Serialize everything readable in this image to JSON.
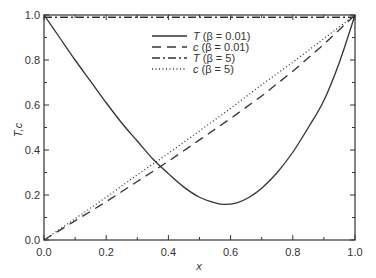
{
  "chart_data": {
    "type": "line",
    "title": "",
    "xlabel": "x",
    "ylabel": "T,c",
    "xlim": [
      0.0,
      1.0
    ],
    "ylim": [
      0.0,
      1.0
    ],
    "grid": false,
    "legend_position": "upper center",
    "x_ticks": [
      "0.0",
      "0.2",
      "0.4",
      "0.6",
      "0.8",
      "1.0"
    ],
    "y_ticks": [
      "0.0",
      "0.2",
      "0.4",
      "0.6",
      "0.8",
      "1.0"
    ],
    "series": [
      {
        "name": "T (β = 0.01)",
        "symbol": "T",
        "param": "(β = 0.01)",
        "style": "solid",
        "x": [
          0.0,
          0.05,
          0.1,
          0.15,
          0.2,
          0.25,
          0.3,
          0.35,
          0.4,
          0.45,
          0.5,
          0.55,
          0.58,
          0.62,
          0.66,
          0.7,
          0.75,
          0.8,
          0.85,
          0.9,
          0.95,
          1.0
        ],
        "values": [
          1.0,
          0.9,
          0.8,
          0.705,
          0.61,
          0.52,
          0.44,
          0.36,
          0.295,
          0.235,
          0.19,
          0.165,
          0.158,
          0.165,
          0.19,
          0.23,
          0.3,
          0.39,
          0.5,
          0.62,
          0.79,
          1.0
        ]
      },
      {
        "name": "c (β = 0.01)",
        "symbol": "c",
        "param": "(β = 0.01)",
        "style": "dashed",
        "x": [
          0.0,
          0.1,
          0.2,
          0.3,
          0.4,
          0.5,
          0.6,
          0.7,
          0.8,
          0.9,
          1.0
        ],
        "values": [
          0.0,
          0.085,
          0.17,
          0.26,
          0.35,
          0.445,
          0.54,
          0.64,
          0.75,
          0.87,
          1.0
        ]
      },
      {
        "name": "T (β = 5)",
        "symbol": "T",
        "param": "(β = 5)",
        "style": "dashdot",
        "x": [
          0.0,
          1.0
        ],
        "values": [
          0.99,
          0.99
        ]
      },
      {
        "name": "c (β = 5)",
        "symbol": "c",
        "param": "(β = 5)",
        "style": "dotted",
        "x": [
          0.0,
          0.1,
          0.2,
          0.3,
          0.4,
          0.5,
          0.6,
          0.7,
          0.8,
          0.9,
          1.0
        ],
        "values": [
          0.0,
          0.095,
          0.19,
          0.29,
          0.385,
          0.485,
          0.585,
          0.69,
          0.79,
          0.895,
          1.0
        ]
      }
    ]
  },
  "axes": {
    "xlabel": "x",
    "ylabel": "T,c"
  }
}
